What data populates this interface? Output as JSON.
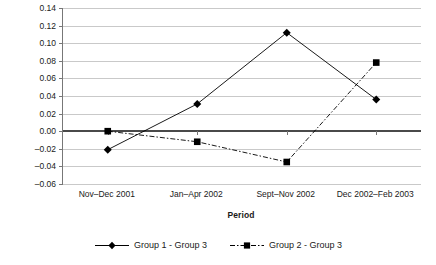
{
  "chart_data": {
    "type": "line",
    "title": "",
    "xlabel": "Period",
    "ylabel": "School Participation Rate",
    "categories": [
      "Nov–Dec 2001",
      "Jan–Apr 2002",
      "Sept–Nov 2002",
      "Dec 2002–Feb 2003"
    ],
    "series": [
      {
        "name": "Group 1 - Group 3",
        "marker": "diamond",
        "linestyle": "solid",
        "color": "#000000",
        "values": [
          -0.021,
          0.031,
          0.112,
          0.036
        ]
      },
      {
        "name": "Group 2 - Group 3",
        "marker": "square",
        "linestyle": "dash-dot",
        "color": "#000000",
        "values": [
          0.0,
          -0.012,
          -0.035,
          0.078
        ]
      }
    ],
    "ylim": [
      -0.06,
      0.14
    ],
    "ytick_values": [
      0.14,
      0.12,
      0.1,
      0.08,
      0.06,
      0.04,
      0.02,
      0.0,
      -0.02,
      -0.04,
      -0.06
    ],
    "ytick_labels": [
      "0.14",
      "0.12",
      "0.10",
      "0.08",
      "0.06",
      "0.04",
      "0.02",
      "0.00",
      "–0.02",
      "–0.04",
      "–0.06"
    ],
    "grid": true,
    "zero_line": true,
    "legend_position": "bottom",
    "gridline_color": "#c9c9c9",
    "zero_line_color": "#4a4a4a",
    "axis_color": "#777777",
    "background": "#ffffff"
  },
  "legend": {
    "entries": [
      {
        "label": "Group 1 - Group 3"
      },
      {
        "label": "Group 2 - Group 3"
      }
    ]
  }
}
